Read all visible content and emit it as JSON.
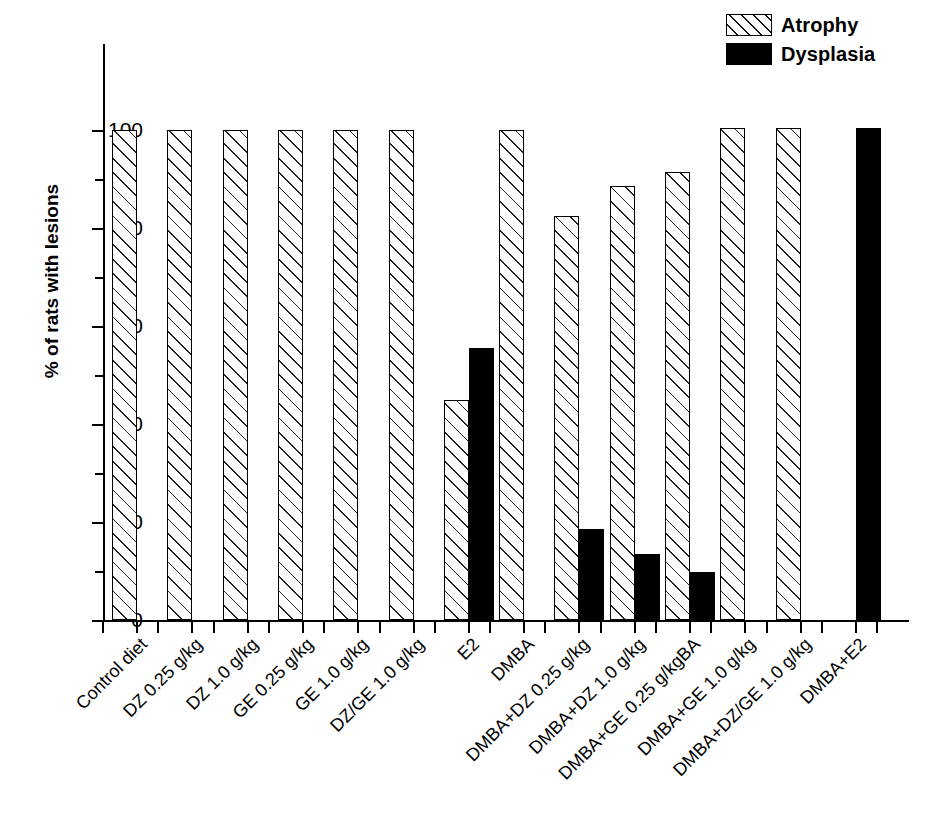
{
  "chart_data": {
    "type": "bar",
    "title": "",
    "xlabel": "",
    "ylabel": "% of rats with lesions",
    "ylim": [
      0,
      105
    ],
    "ytick_labels": [
      "0",
      "20",
      "40",
      "60",
      "80",
      "100"
    ],
    "ytick_values": [
      0,
      20,
      40,
      60,
      80,
      100
    ],
    "yminor_values": [
      10,
      30,
      50,
      70,
      90
    ],
    "grid": false,
    "legend_position": "top-right",
    "categories": [
      "Control diet",
      "DZ 0.25 g/kg",
      "DZ 1.0 g/kg",
      "GE 0.25 g/kg",
      "GE 1.0 g/kg",
      "DZ/GE 1.0 g/kg",
      "E2",
      "DMBA",
      "DMBA+DZ 0.25 g/kg",
      "DMBA+DZ 1.0 g/kg",
      "DMBA+GE 0.25 g/kgBA",
      "DMBA+GE 1.0 g/kg",
      "DMBA+DZ/GE 1.0 g/kg",
      "DMBA+E2"
    ],
    "series": [
      {
        "name": "Atrophy",
        "fill": "hatch",
        "color": "#ffffff",
        "values": [
          100,
          100,
          100,
          100,
          100,
          100,
          45,
          100,
          82.5,
          88.5,
          91.5,
          100.5,
          100.5,
          0
        ]
      },
      {
        "name": "Dysplasia",
        "fill": "solid",
        "color": "#000000",
        "values": [
          0,
          0,
          0,
          0,
          0,
          0,
          55.5,
          0,
          18.5,
          13.5,
          9.8,
          0,
          0,
          100.5
        ]
      }
    ]
  },
  "legend": {
    "items": [
      {
        "label": "Atrophy",
        "swatch": "hatch"
      },
      {
        "label": "Dysplasia",
        "swatch": "solid"
      }
    ]
  }
}
